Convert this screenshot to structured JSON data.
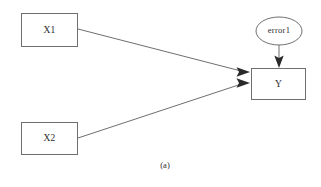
{
  "figure": {
    "caption": "(a)",
    "background_color": "#ffffff",
    "shape_stroke_color": "#6f6f72",
    "edge_stroke_color": "#5d5d60",
    "text_color": "#2b2b2b"
  },
  "nodes": {
    "x1": {
      "label": "X1",
      "shape": "rectangle",
      "x": 21,
      "y": 13,
      "width": 57,
      "height": 34,
      "center_x": 49.5,
      "center_y": 30
    },
    "x2": {
      "label": "X2",
      "shape": "rectangle",
      "x": 21,
      "y": 122,
      "width": 57,
      "height": 33,
      "center_x": 49.5,
      "center_y": 138
    },
    "y": {
      "label": "Y",
      "shape": "rectangle",
      "x": 251,
      "y": 68,
      "width": 55,
      "height": 32,
      "center_x": 278.5,
      "center_y": 84
    },
    "error1": {
      "label": "error1",
      "shape": "ellipse",
      "center_x": 279,
      "center_y": 31,
      "rx": 23,
      "ry": 14
    }
  },
  "edges": [
    {
      "name": "x1-to-y",
      "from": "x1",
      "to": "y",
      "arrowhead": "filled-triangle",
      "x1": 78,
      "y1": 29,
      "x2": 249,
      "y2": 72
    },
    {
      "name": "x2-to-y",
      "from": "x2",
      "to": "y",
      "arrowhead": "filled-triangle",
      "x1": 78,
      "y1": 138,
      "x2": 249,
      "y2": 83
    },
    {
      "name": "error1-to-y",
      "from": "error1",
      "to": "y",
      "arrowhead": "filled-triangle",
      "x1": 279,
      "y1": 45,
      "x2": 279,
      "y2": 67
    }
  ]
}
